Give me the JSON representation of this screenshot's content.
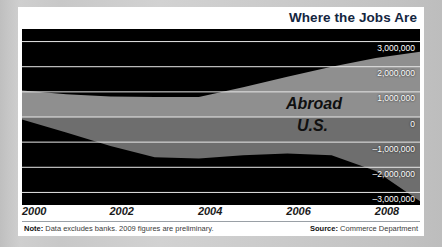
{
  "chart_title": "Where the Jobs Are",
  "footer": {
    "note_label": "Note:",
    "note_text": " Data excludes banks. 2009 figures are preliminary.",
    "source_label": "Source:",
    "source_text": " Commerce Department"
  },
  "chart_data": {
    "type": "area",
    "title": "Where the Jobs Are",
    "xlabel": "",
    "ylabel": "",
    "grid": true,
    "legend_position": "inline-labels",
    "xlim": [
      2000,
      2009
    ],
    "ylim": [
      -3500000,
      3500000
    ],
    "x": [
      2000,
      2001,
      2002,
      2003,
      2004,
      2005,
      2006,
      2007,
      2008,
      2009
    ],
    "xticks": [
      2000,
      2002,
      2004,
      2006,
      2008
    ],
    "xticklabels": [
      "2000",
      "2002",
      "2004",
      "2006",
      "2008"
    ],
    "yticks": [
      3000000,
      2000000,
      1000000,
      0,
      -1000000,
      -2000000,
      -3000000
    ],
    "yticklabels": [
      "3,000,000",
      "2,000,000",
      "1,000,000",
      "0",
      "–1,000,000",
      "–2,000,000",
      "–3,000,000"
    ],
    "series": [
      {
        "name": "Abroad",
        "color": "#8f8f8f",
        "values": [
          1050000,
          900000,
          820000,
          800000,
          800000,
          1180000,
          1600000,
          2000000,
          2350000,
          2600000
        ]
      },
      {
        "name": "U.S.",
        "color": "#6e6e6e",
        "values": [
          -100000,
          -620000,
          -1150000,
          -1600000,
          -1650000,
          -1520000,
          -1450000,
          -1520000,
          -2150000,
          -3350000
        ]
      }
    ],
    "annotations": [
      {
        "text": "Abroad",
        "x": 2007.1,
        "y": 1000000
      },
      {
        "text": "U.S.",
        "x": 2007.1,
        "y": -150000
      }
    ],
    "colors": {
      "plot_background": "#000000",
      "gridline": "#e8e8e8",
      "title": "#14263f",
      "tick_label": "#ffffff",
      "xtick_label": "#1b1b1b",
      "card_background": "#ffffff",
      "page_background": "#c9c9c9"
    }
  }
}
